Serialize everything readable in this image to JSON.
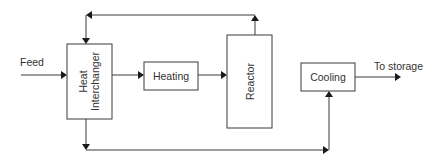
{
  "diagram": {
    "type": "process-flow",
    "inputs": {
      "feed": "Feed"
    },
    "outputs": {
      "to_storage": "To storage"
    },
    "units": {
      "heat_interchanger": {
        "line1": "Heat",
        "line2": "Interchanger"
      },
      "heating": "Heating",
      "reactor": "Reactor",
      "cooling": "Cooling"
    },
    "connections": [
      {
        "from": "Feed",
        "to": "Heat Interchanger"
      },
      {
        "from": "Heat Interchanger",
        "to": "Heating"
      },
      {
        "from": "Heating",
        "to": "Reactor"
      },
      {
        "from": "Reactor",
        "to": "Heat Interchanger",
        "route": "top loop"
      },
      {
        "from": "Heat Interchanger",
        "to": "Cooling",
        "route": "bottom loop"
      },
      {
        "from": "Cooling",
        "to": "To storage"
      }
    ],
    "colors": {
      "stroke": "#3a3a3a",
      "arrow": "#1a1a1a",
      "text": "#333333",
      "background": "#ffffff"
    }
  }
}
